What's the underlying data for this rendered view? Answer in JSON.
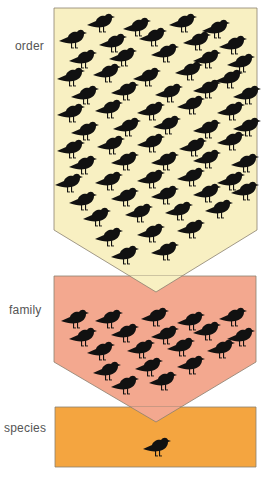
{
  "labels": {
    "order": "order",
    "family": "family",
    "species": "species"
  },
  "colors": {
    "order_fill": "#F8F0C2",
    "family_fill": "#F3A88F",
    "species_fill": "#F4A540",
    "outline": "#8a8070",
    "bird": "#111111",
    "label_text": "#555555"
  },
  "levels": [
    {
      "name": "order",
      "shape": "54,8 257,8 257,230 156,292 54,230",
      "birds": [
        [
          100,
          22
        ],
        [
          136,
          26
        ],
        [
          182,
          22
        ],
        [
          215,
          28
        ],
        [
          72,
          38
        ],
        [
          112,
          42
        ],
        [
          152,
          36
        ],
        [
          196,
          40
        ],
        [
          232,
          44
        ],
        [
          82,
          58
        ],
        [
          122,
          56
        ],
        [
          164,
          52
        ],
        [
          206,
          58
        ],
        [
          240,
          62
        ],
        [
          70,
          76
        ],
        [
          106,
          72
        ],
        [
          146,
          76
        ],
        [
          188,
          70
        ],
        [
          228,
          78
        ],
        [
          84,
          94
        ],
        [
          124,
          90
        ],
        [
          168,
          92
        ],
        [
          206,
          88
        ],
        [
          246,
          94
        ],
        [
          70,
          112
        ],
        [
          108,
          108
        ],
        [
          150,
          110
        ],
        [
          190,
          104
        ],
        [
          230,
          110
        ],
        [
          84,
          130
        ],
        [
          126,
          126
        ],
        [
          166,
          124
        ],
        [
          206,
          128
        ],
        [
          246,
          126
        ],
        [
          70,
          148
        ],
        [
          110,
          144
        ],
        [
          150,
          142
        ],
        [
          192,
          146
        ],
        [
          230,
          140
        ],
        [
          82,
          164
        ],
        [
          124,
          160
        ],
        [
          164,
          160
        ],
        [
          206,
          158
        ],
        [
          244,
          162
        ],
        [
          68,
          182
        ],
        [
          108,
          180
        ],
        [
          150,
          178
        ],
        [
          190,
          176
        ],
        [
          230,
          180
        ],
        [
          82,
          200
        ],
        [
          124,
          196
        ],
        [
          164,
          194
        ],
        [
          206,
          192
        ],
        [
          244,
          190
        ],
        [
          96,
          216
        ],
        [
          138,
          212
        ],
        [
          178,
          210
        ],
        [
          218,
          208
        ],
        [
          108,
          236
        ],
        [
          150,
          232
        ],
        [
          190,
          228
        ],
        [
          124,
          254
        ],
        [
          164,
          250
        ]
      ]
    },
    {
      "name": "family",
      "shape": "54,276 256,276 256,362 156,422 54,362",
      "birds": [
        [
          74,
          318
        ],
        [
          108,
          318
        ],
        [
          154,
          316
        ],
        [
          190,
          320
        ],
        [
          232,
          316
        ],
        [
          82,
          336
        ],
        [
          124,
          332
        ],
        [
          164,
          334
        ],
        [
          206,
          330
        ],
        [
          240,
          336
        ],
        [
          100,
          350
        ],
        [
          140,
          348
        ],
        [
          180,
          346
        ],
        [
          220,
          348
        ],
        [
          106,
          370
        ],
        [
          148,
          366
        ],
        [
          190,
          364
        ],
        [
          124,
          384
        ],
        [
          162,
          380
        ]
      ]
    },
    {
      "name": "species",
      "shape": "55,407 256,407 256,467 55,467",
      "birds": [
        [
          156,
          446
        ]
      ]
    }
  ]
}
